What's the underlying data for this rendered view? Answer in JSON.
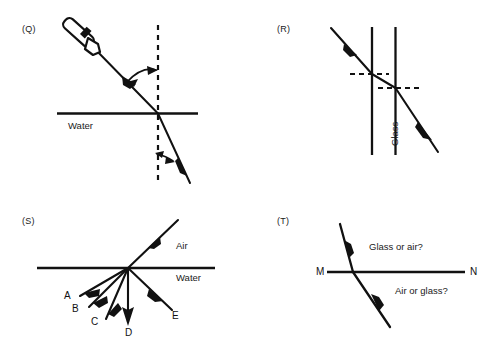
{
  "figure": {
    "panels": [
      {
        "id": "Q",
        "label": "(Q)",
        "medium_label": "Water",
        "icon": "torch-icon",
        "normal_style": "dashed-vertical",
        "rays": [
          "incident-ray",
          "refracted-ray"
        ],
        "angle_markers": [
          "angle-of-incidence-arc",
          "angle-of-refraction-arc"
        ]
      },
      {
        "id": "R",
        "label": "(R)",
        "medium_label": "Glass",
        "normal_style": "dashed-horizontal",
        "rays": [
          "incident-ray",
          "ray-inside-glass",
          "emergent-ray"
        ],
        "interfaces": 2
      },
      {
        "id": "S",
        "label": "(S)",
        "upper_medium_label": "Air",
        "lower_medium_label": "Water",
        "incident_ray": "incident-ray",
        "candidate_rays": [
          "A",
          "B",
          "C",
          "D",
          "E"
        ]
      },
      {
        "id": "T",
        "label": "(T)",
        "boundary_left_label": "M",
        "boundary_right_label": "N",
        "upper_question": "Glass or air?",
        "lower_question": "Air or glass?",
        "rays": [
          "incident-ray",
          "refracted-ray"
        ]
      }
    ],
    "colors": {
      "ink": "#111111",
      "background": "#ffffff"
    }
  }
}
